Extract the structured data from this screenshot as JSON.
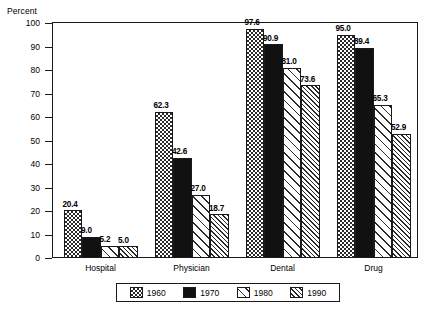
{
  "chart_data": {
    "type": "bar",
    "title": "",
    "xlabel": "",
    "ylabel": "Percent",
    "ylim": [
      0,
      100
    ],
    "yticks": [
      0,
      10,
      20,
      30,
      40,
      50,
      60,
      70,
      80,
      90,
      100
    ],
    "grid": false,
    "legend_position": "bottom",
    "categories": [
      "Hospital",
      "Physician",
      "Dental",
      "Drug"
    ],
    "series": [
      {
        "name": "1960",
        "pattern": "checkerboard",
        "values": [
          20.4,
          62.3,
          97.6,
          95.0
        ]
      },
      {
        "name": "1970",
        "pattern": "solid-black",
        "values": [
          9.0,
          42.6,
          90.9,
          89.4
        ]
      },
      {
        "name": "1980",
        "pattern": "wide-diagonal",
        "values": [
          5.2,
          27.0,
          81.0,
          65.3
        ]
      },
      {
        "name": "1990",
        "pattern": "dense-diagonal",
        "values": [
          5.0,
          18.7,
          73.6,
          52.9
        ]
      }
    ],
    "data_labels": [
      [
        "20.4",
        "9.0",
        "5.2",
        "5.0"
      ],
      [
        "62.3",
        "42.6",
        "27.0",
        "18.7"
      ],
      [
        "97.6",
        "90.9",
        "81.0",
        "73.6"
      ],
      [
        "95.0",
        "89.4",
        "65.3",
        "52.9"
      ]
    ],
    "ytick_labels": [
      "0",
      "10",
      "20",
      "30",
      "40",
      "50",
      "60",
      "70",
      "80",
      "90",
      "100"
    ]
  },
  "legend": {
    "items": [
      {
        "label": "1960"
      },
      {
        "label": "1970"
      },
      {
        "label": "1980"
      },
      {
        "label": "1990"
      }
    ]
  },
  "colors": {
    "ink": "#1a1a1a",
    "fill_1970": "#111111",
    "background": "#ffffff"
  }
}
